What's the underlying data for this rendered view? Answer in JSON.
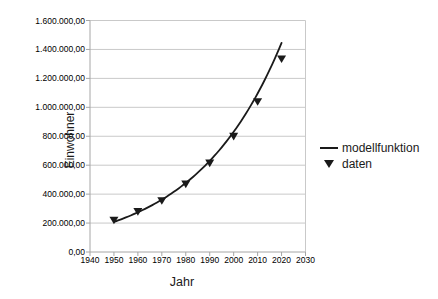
{
  "chart_data": {
    "type": "line",
    "title": "",
    "xlabel": "Jahr",
    "ylabel": "Einwohner",
    "xlim": [
      1940,
      2030
    ],
    "ylim": [
      0,
      1600000
    ],
    "grid": true,
    "legend_position": "right",
    "x_ticks": [
      1940,
      1950,
      1960,
      1970,
      1980,
      1990,
      2000,
      2010,
      2020,
      2030
    ],
    "y_ticks": [
      {
        "value": 0,
        "label": "0,00"
      },
      {
        "value": 200000,
        "label": "200.000,00"
      },
      {
        "value": 400000,
        "label": "400.000,00"
      },
      {
        "value": 600000,
        "label": "600.000,00"
      },
      {
        "value": 800000,
        "label": "800.000,00"
      },
      {
        "value": 1000000,
        "label": "1.000.000,00"
      },
      {
        "value": 1200000,
        "label": "1.200.000,00"
      },
      {
        "value": 1400000,
        "label": "1.400.000,00"
      },
      {
        "value": 1600000,
        "label": "1.600.000,00"
      }
    ],
    "series": [
      {
        "name": "modellfunktion",
        "type": "line",
        "model": "exponential",
        "x_start": 1950,
        "x_end": 2020,
        "y_start": 208000,
        "y_end": 1445000,
        "color": "#1a1a1a"
      },
      {
        "name": "daten",
        "type": "scatter",
        "marker": "triangle-down",
        "color": "#1a1a1a",
        "x": [
          1950,
          1960,
          1970,
          1980,
          1990,
          2000,
          2010,
          2020
        ],
        "y": [
          220000,
          280000,
          355000,
          470000,
          615000,
          800000,
          1040000,
          1335000
        ]
      }
    ],
    "legend": {
      "entries": [
        {
          "swatch": "line",
          "label": "modellfunktion"
        },
        {
          "swatch": "triangle-down",
          "label": "daten"
        }
      ]
    },
    "colors": {
      "grid": "#c9c9c9",
      "axis": "#a6a6a6",
      "text": "#000000",
      "series": "#1a1a1a",
      "background": "#ffffff"
    }
  }
}
